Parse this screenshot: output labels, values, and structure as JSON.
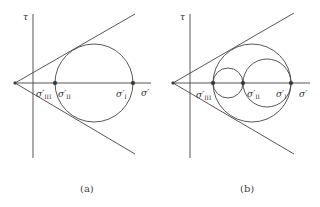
{
  "figure": {
    "panels": [
      {
        "id": "a",
        "caption": "(a)",
        "y_axis_label": "τ",
        "x_axis_label": "σ′",
        "points": [
          {
            "symbol": "σ′",
            "subscript": "III"
          },
          {
            "symbol": "σ′",
            "subscript": "II"
          },
          {
            "symbol": "σ′",
            "subscript": "I"
          }
        ],
        "description": "Mohr circle between σ′II and σ′I tangent to two straight failure envelope lines from a common apex on the σ′ axis"
      },
      {
        "id": "b",
        "caption": "(b)",
        "y_axis_label": "τ",
        "x_axis_label": "σ′",
        "points": [
          {
            "symbol": "σ′",
            "subscript": "III"
          },
          {
            "symbol": "σ′",
            "subscript": "II"
          },
          {
            "symbol": "σ′",
            "subscript": "I"
          }
        ],
        "description": "Three Mohr circles (σ′III–σ′II, σ′II–σ′I, σ′III–σ′I); largest circle tangent to failure envelope lines"
      }
    ],
    "colors": {
      "line": "#444444",
      "background": "#ffffff"
    }
  }
}
